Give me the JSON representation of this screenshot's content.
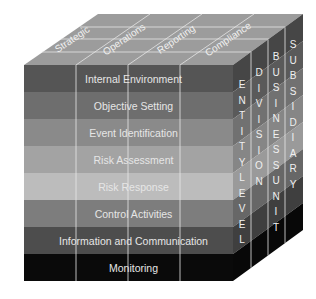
{
  "diagram": {
    "title": "",
    "top_face": {
      "labels": [
        "Strategic",
        "Operations",
        "Reporting",
        "Compliance"
      ],
      "color": "#9a9a9a"
    },
    "front_face": {
      "bands": [
        {
          "label": "Internal Environment",
          "color": "#555555"
        },
        {
          "label": "Objective Setting",
          "color": "#6e6e6e"
        },
        {
          "label": "Event Identification",
          "color": "#8a8a8a"
        },
        {
          "label": "Risk Assessment",
          "color": "#a3a3a3"
        },
        {
          "label": "Risk Response",
          "color": "#bcbcbc"
        },
        {
          "label": "Control Activities",
          "color": "#7d7d7d"
        },
        {
          "label": "Information and Communication",
          "color": "#4d4d4d"
        },
        {
          "label": "Monitoring",
          "color": "#0a0a0a"
        }
      ]
    },
    "right_face": {
      "columns": [
        {
          "label": "ENTITY LEVEL",
          "letters": [
            "E",
            "N",
            "T",
            "I",
            "T",
            "Y",
            "L",
            "E",
            "V",
            "E",
            "L"
          ]
        },
        {
          "label": "DIVISION",
          "letters": [
            "D",
            "I",
            "V",
            "I",
            "S",
            "I",
            "O",
            "N"
          ]
        },
        {
          "label": "BUSINESS UNIT",
          "letters": [
            "B",
            "U",
            "S",
            "I",
            "N",
            "E",
            "S",
            "S",
            "U",
            "N",
            "I",
            "T"
          ]
        },
        {
          "label": "SUBSIDIARY",
          "letters": [
            "S",
            "U",
            "B",
            "S",
            "I",
            "D",
            "I",
            "A",
            "R",
            "Y"
          ]
        }
      ]
    },
    "line_color": "#e8e8e8"
  }
}
